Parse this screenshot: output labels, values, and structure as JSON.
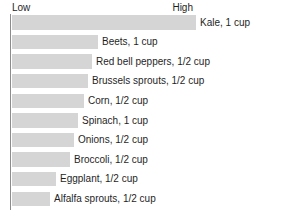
{
  "scale": {
    "low_label": "Low",
    "high_label": "High"
  },
  "style": {
    "bar_color": "#d5d5d5",
    "axis_color": "#8c8c8c",
    "text_color": "#1f1f1f",
    "background": "#ffffff"
  },
  "chart_data": {
    "type": "bar",
    "orientation": "horizontal",
    "title": "",
    "subtitle": "",
    "xlabel": "",
    "ylabel": "",
    "axis_tick_labels": [
      "Low",
      "High"
    ],
    "grid": false,
    "legend": false,
    "value_unit": "relative (Low to High)",
    "xlim": [
      0,
      100
    ],
    "categories": [
      "Kale, 1 cup",
      "Beets, 1 cup",
      "Red bell peppers, 1/2 cup",
      "Brussels sprouts, 1/2 cup",
      "Corn, 1/2 cup",
      "Spinach, 1 cup",
      "Onions, 1/2 cup",
      "Broccoli, 1/2 cup",
      "Eggplant, 1/2 cup",
      "Alfalfa sprouts, 1/2 cup"
    ],
    "values": [
      100,
      47,
      44,
      41,
      39,
      36,
      34,
      31,
      24,
      21
    ],
    "bars": [
      {
        "label": "Kale, 1 cup",
        "value": 100,
        "bar_width_px": 184
      },
      {
        "label": "Beets, 1 cup",
        "value": 47,
        "bar_width_px": 86
      },
      {
        "label": "Red bell peppers, 1/2 cup",
        "value": 44,
        "bar_width_px": 80
      },
      {
        "label": "Brussels sprouts, 1/2 cup",
        "value": 41,
        "bar_width_px": 76
      },
      {
        "label": "Corn, 1/2 cup",
        "value": 39,
        "bar_width_px": 72
      },
      {
        "label": "Spinach, 1 cup",
        "value": 36,
        "bar_width_px": 66
      },
      {
        "label": "Onions, 1/2 cup",
        "value": 34,
        "bar_width_px": 62
      },
      {
        "label": "Broccoli, 1/2 cup",
        "value": 31,
        "bar_width_px": 58
      },
      {
        "label": "Eggplant, 1/2 cup",
        "value": 24,
        "bar_width_px": 44
      },
      {
        "label": "Alfalfa sprouts, 1/2 cup",
        "value": 21,
        "bar_width_px": 38
      }
    ]
  }
}
